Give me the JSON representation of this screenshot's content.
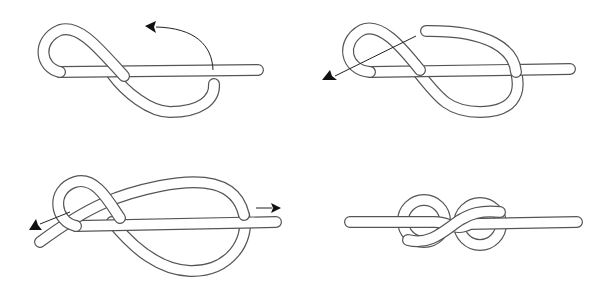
{
  "diagram": {
    "title": "",
    "colors": {
      "background": "#ffffff",
      "rope_outline": "#555555",
      "rope_fill": "#ffffff",
      "arrow": "#111111"
    },
    "steps": [
      {
        "index": 1,
        "position": "top-left",
        "description": "Make a loop, bring the working end under the standing part",
        "arrow": "curved arrow pointing left over the standing part"
      },
      {
        "index": 2,
        "position": "top-right",
        "description": "Working end passes over the standing part, forming a figure eight",
        "arrow": "straight arrow pointing down-left through the first loop"
      },
      {
        "index": 3,
        "position": "bottom-left",
        "description": "Working end threaded through the first loop",
        "arrow": "arrows pulling both ends apart (left and right)"
      },
      {
        "index": 4,
        "position": "bottom-right",
        "description": "Finished, tightened figure-eight knot",
        "arrow": "none"
      }
    ]
  }
}
